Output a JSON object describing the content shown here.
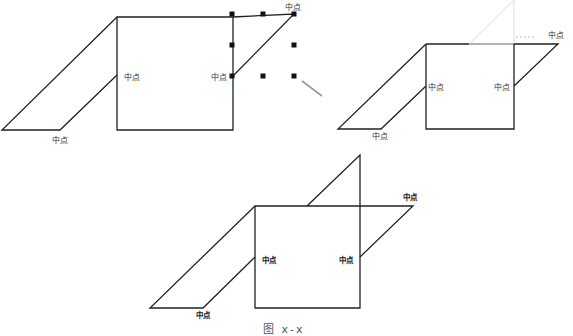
{
  "figure": {
    "colors": {
      "line": "#222222",
      "ghost_line": "#d8d8d8",
      "gray_segment": "#9a9a9a",
      "handle": "#111111",
      "arrow": "#999999",
      "label": "#333333"
    },
    "caption": "图 x-x",
    "panels": [
      {
        "id": "top-left",
        "labels": [
          {
            "text": "中点",
            "x": 285,
            "y": 4
          },
          {
            "text": "中点",
            "x": 124,
            "y": 74
          },
          {
            "text": "中点",
            "x": 211,
            "y": 74
          },
          {
            "text": "中点",
            "x": 52,
            "y": 137
          }
        ],
        "shapes": {
          "square": [
            [
              117,
              17
            ],
            [
              233,
              17
            ],
            [
              233,
              130
            ],
            [
              117,
              130
            ]
          ],
          "left_parallelogram": [
            [
              117,
              17
            ],
            [
              2,
              130
            ],
            [
              60,
              130
            ],
            [
              117,
              75
            ]
          ],
          "right_piece": [
            [
              233,
              17
            ],
            [
              294,
              14
            ],
            [
              233,
              76
            ]
          ]
        },
        "selection_handles": [
          [
            232,
            14
          ],
          [
            263,
            14
          ],
          [
            294,
            14
          ],
          [
            232,
            45
          ],
          [
            294,
            45
          ],
          [
            232,
            76
          ],
          [
            263,
            76
          ],
          [
            294,
            76
          ]
        ],
        "arrow": {
          "from": [
            322,
            96
          ],
          "to": [
            302,
            81
          ]
        }
      },
      {
        "id": "top-right",
        "labels": [
          {
            "text": "中点",
            "x": 548,
            "y": 32
          },
          {
            "text": "中点",
            "x": 428,
            "y": 84
          },
          {
            "text": "中点",
            "x": 494,
            "y": 84
          },
          {
            "text": "中点",
            "x": 372,
            "y": 133
          }
        ],
        "shapes": {
          "square": [
            [
              426,
              44
            ],
            [
              514,
              44
            ],
            [
              514,
              129
            ],
            [
              426,
              129
            ]
          ],
          "left_parallelogram": [
            [
              426,
              44
            ],
            [
              338,
              129
            ],
            [
              381,
              129
            ],
            [
              426,
              86
            ]
          ],
          "right_piece": [
            [
              514,
              44
            ],
            [
              558,
              44
            ],
            [
              514,
              86
            ]
          ],
          "ghost_triangle": [
            [
              469,
              44
            ],
            [
              514,
              0
            ],
            [
              514,
              44
            ]
          ]
        }
      },
      {
        "id": "bottom",
        "labels": [
          {
            "text": "中点",
            "x": 403,
            "y": 194
          },
          {
            "text": "中点",
            "x": 262,
            "y": 257
          },
          {
            "text": "中点",
            "x": 339,
            "y": 257
          },
          {
            "text": "中点",
            "x": 196,
            "y": 312
          }
        ],
        "shapes": {
          "square": [
            [
              255,
              206
            ],
            [
              360,
              206
            ],
            [
              360,
              308
            ],
            [
              255,
              308
            ]
          ],
          "left_parallelogram": [
            [
              255,
              206
            ],
            [
              150,
              308
            ],
            [
              203,
              308
            ],
            [
              255,
              257
            ]
          ],
          "right_piece": [
            [
              360,
              206
            ],
            [
              413,
              206
            ],
            [
              360,
              257
            ]
          ],
          "top_triangle": [
            [
              307,
              206
            ],
            [
              360,
              155
            ],
            [
              360,
              206
            ]
          ]
        }
      }
    ]
  }
}
